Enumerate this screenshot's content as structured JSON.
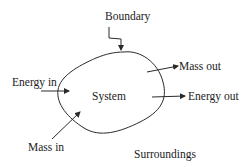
{
  "diagram": {
    "type": "thermodynamic-open-system",
    "colors": {
      "stroke": "#2a2a2a",
      "text": "#222222",
      "background": "#ffffff"
    },
    "labels": {
      "boundary": "Boundary",
      "energy_in": "Energy in",
      "system": "System",
      "mass_out": "Mass out",
      "energy_out": "Energy out",
      "mass_in": "Mass in",
      "surroundings": "Surroundings"
    },
    "arrows": [
      {
        "name": "boundary-pointer",
        "from": "Boundary label",
        "to": "system boundary"
      },
      {
        "name": "energy-in-arrow",
        "from": "surroundings",
        "to": "system"
      },
      {
        "name": "mass-in-arrow",
        "from": "surroundings",
        "to": "system"
      },
      {
        "name": "mass-out-arrow",
        "from": "system",
        "to": "surroundings"
      },
      {
        "name": "energy-out-arrow",
        "from": "system",
        "to": "surroundings"
      }
    ]
  }
}
